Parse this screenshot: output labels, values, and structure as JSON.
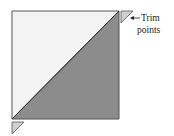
{
  "diagram": {
    "label_line1": "Trim",
    "label_line2": "points",
    "colors": {
      "light_fill": "#f4f4f4",
      "dark_fill": "#8c8c8c",
      "trim_fill": "#cfcfcf",
      "stroke": "#444444"
    }
  }
}
